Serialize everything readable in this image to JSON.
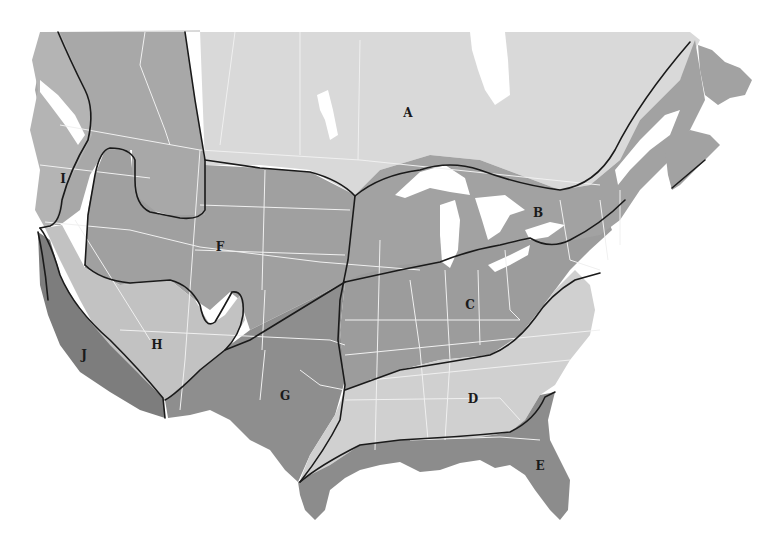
{
  "map": {
    "type": "region-zone map",
    "colors": {
      "background": "#ffffff",
      "zone_light": "#d8d8d8",
      "zone_lighter": "#cfcfcf",
      "zone_medium": "#a6a6a6",
      "zone_medium_light": "#b6b6b6",
      "zone_dark": "#8c8c8c",
      "zone_darkest": "#7a7a7a",
      "state_borders": "#f2f2f2",
      "zone_boundaries": "#1a1a1a",
      "water": "#ffffff"
    },
    "regions": [
      {
        "id": "A",
        "label": "A",
        "x": 408,
        "y": 113
      },
      {
        "id": "B",
        "label": "B",
        "x": 538,
        "y": 213
      },
      {
        "id": "C",
        "label": "C",
        "x": 470,
        "y": 305
      },
      {
        "id": "D",
        "label": "D",
        "x": 473,
        "y": 399
      },
      {
        "id": "E",
        "label": "E",
        "x": 540,
        "y": 466
      },
      {
        "id": "F",
        "label": "F",
        "x": 220,
        "y": 247
      },
      {
        "id": "G",
        "label": "G",
        "x": 285,
        "y": 396
      },
      {
        "id": "H",
        "label": "H",
        "x": 157,
        "y": 345
      },
      {
        "id": "I",
        "label": "I",
        "x": 63,
        "y": 179
      },
      {
        "id": "J",
        "label": "J",
        "x": 84,
        "y": 355
      }
    ]
  }
}
